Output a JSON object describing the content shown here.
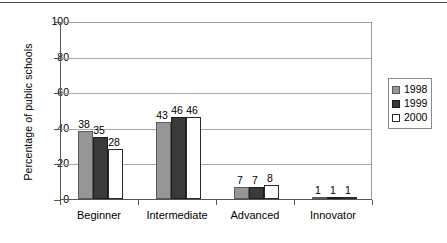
{
  "chart_data": {
    "type": "bar",
    "title": "",
    "xlabel": "",
    "ylabel": "Percentage of public schools",
    "categories": [
      "Beginner",
      "Intermediate",
      "Advanced",
      "Innovator"
    ],
    "series": [
      {
        "name": "1998",
        "values": [
          38,
          43,
          7,
          1
        ],
        "color": "#969696"
      },
      {
        "name": "1999",
        "values": [
          35,
          46,
          7,
          1
        ],
        "color": "#3a3a3a"
      },
      {
        "name": "2000",
        "values": [
          28,
          46,
          8,
          1
        ],
        "color": "#ffffff"
      }
    ],
    "ylim": [
      0,
      100
    ],
    "yticks": [
      0,
      20,
      40,
      60,
      80,
      100
    ],
    "ytick_labels": [
      "0",
      "20",
      "40",
      "60",
      "80",
      "100"
    ],
    "grid": "horizontal",
    "legend_position": "right",
    "data_labels": true
  },
  "legend": {
    "entries": [
      {
        "label": "1998"
      },
      {
        "label": "1999"
      },
      {
        "label": "2000"
      }
    ]
  }
}
